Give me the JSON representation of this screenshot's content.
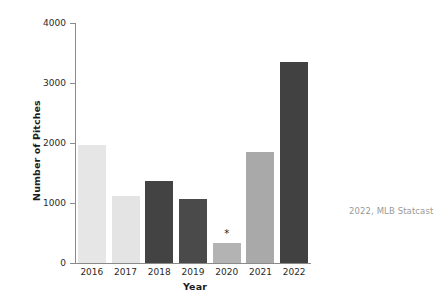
{
  "chart_data": {
    "type": "bar",
    "title": "",
    "xlabel": "Year",
    "ylabel": "Number of Pitches",
    "categories": [
      "2016",
      "2017",
      "2018",
      "2019",
      "2020",
      "2021",
      "2022"
    ],
    "values": [
      1960,
      1110,
      1370,
      1070,
      330,
      1850,
      3355
    ],
    "bar_colors": [
      "#e6e6e6",
      "#e4e4e4",
      "#434343",
      "#4a4a4a",
      "#b3b3b3",
      "#a9a9a9",
      "#414141"
    ],
    "ylim": [
      0,
      4000
    ],
    "ytick_labels": [
      "0",
      "1000",
      "2000",
      "3000",
      "4000"
    ],
    "ytick_values": [
      0,
      1000,
      2000,
      3000,
      4000
    ],
    "grid": false,
    "legend": "none",
    "annotations": [
      {
        "category": "2020",
        "text": "*"
      }
    ],
    "caption": "2022, MLB Statcast"
  },
  "colors": {
    "axis": "#8a8a8a",
    "tick_text": "#2a2a2a",
    "axis_label": "#1c1c1c",
    "caption": "#9a9a9a",
    "background": "#ffffff"
  }
}
